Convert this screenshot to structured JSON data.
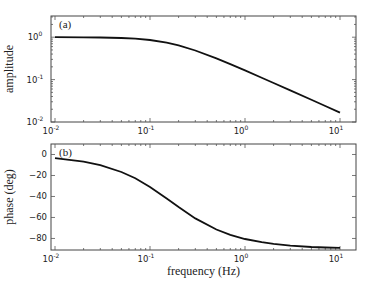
{
  "chart_data": [
    {
      "id": "a",
      "type": "line",
      "panel_label": "(a)",
      "title": "",
      "xlabel": "",
      "ylabel": "amplitude",
      "xscale": "log",
      "yscale": "log",
      "xlim": [
        0.01,
        10
      ],
      "ylim": [
        0.01,
        3.16
      ],
      "x_ticks": [
        {
          "base": "10",
          "exp": "-2",
          "value": 0.01
        },
        {
          "base": "10",
          "exp": "-1",
          "value": 0.1
        },
        {
          "base": "10",
          "exp": "0",
          "value": 1
        },
        {
          "base": "10",
          "exp": "1",
          "value": 10
        }
      ],
      "y_ticks": [
        {
          "base": "10",
          "exp": "-2",
          "value": 0.01
        },
        {
          "base": "10",
          "exp": "-1",
          "value": 0.1
        },
        {
          "base": "10",
          "exp": "0",
          "value": 1
        }
      ],
      "grid": false,
      "legend": null,
      "series": [
        {
          "name": "amplitude",
          "color": "#111111",
          "x": [
            0.01,
            0.02,
            0.03,
            0.05,
            0.07,
            0.1,
            0.15,
            0.2,
            0.3,
            0.5,
            0.7,
            1,
            1.5,
            2,
            3,
            5,
            7,
            10
          ],
          "y": [
            0.998,
            0.993,
            0.984,
            0.958,
            0.922,
            0.858,
            0.744,
            0.641,
            0.486,
            0.317,
            0.232,
            0.165,
            0.111,
            0.083,
            0.0556,
            0.0334,
            0.0239,
            0.0167
          ]
        }
      ]
    },
    {
      "id": "b",
      "type": "line",
      "panel_label": "(b)",
      "title": "",
      "xlabel": "frequency (Hz)",
      "ylabel": "phase (deg)",
      "xscale": "log",
      "yscale": "linear",
      "xlim": [
        0.01,
        10
      ],
      "ylim": [
        -91,
        10
      ],
      "x_ticks": [
        {
          "base": "10",
          "exp": "-2",
          "value": 0.01
        },
        {
          "base": "10",
          "exp": "-1",
          "value": 0.1
        },
        {
          "base": "10",
          "exp": "0",
          "value": 1
        },
        {
          "base": "10",
          "exp": "1",
          "value": 10
        }
      ],
      "y_ticks": [
        {
          "label": "0",
          "value": 0
        },
        {
          "label": "−20",
          "value": -20
        },
        {
          "label": "−40",
          "value": -40
        },
        {
          "label": "−60",
          "value": -60
        },
        {
          "label": "−80",
          "value": -80
        }
      ],
      "grid": false,
      "legend": null,
      "series": [
        {
          "name": "phase",
          "color": "#111111",
          "x": [
            0.01,
            0.02,
            0.03,
            0.05,
            0.07,
            0.1,
            0.15,
            0.2,
            0.3,
            0.5,
            0.7,
            1,
            1.5,
            2,
            3,
            5,
            7,
            10
          ],
          "y": [
            -3.4,
            -6.8,
            -10.2,
            -16.7,
            -22.7,
            -30.9,
            -42.0,
            -50.1,
            -60.9,
            -71.5,
            -76.6,
            -80.5,
            -83.6,
            -85.2,
            -86.8,
            -88.1,
            -88.6,
            -89.0
          ]
        }
      ]
    }
  ],
  "layout": {
    "panels": [
      {
        "left": 51,
        "top": 16,
        "width": 305,
        "height": 106,
        "x_data_left": 55,
        "x_data_right": 340
      },
      {
        "left": 51,
        "top": 144,
        "width": 305,
        "height": 106,
        "x_data_left": 55,
        "x_data_right": 340
      }
    ]
  }
}
